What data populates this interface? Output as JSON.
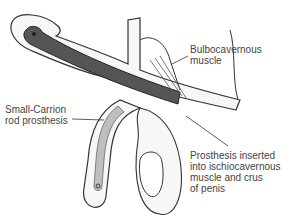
{
  "figure": {
    "labels": {
      "bulbocavernous": "Bulbocavernous\nmuscle",
      "rod": "Small-Carrion\nrod prosthesis",
      "inserted": "Prosthesis inserted\ninto ischiocavernous\nmuscle and crus\nof penis"
    },
    "colors": {
      "line": "#333333",
      "rod_dark": "#555555",
      "rod_light": "#bfbfbf",
      "text": "#444444"
    }
  }
}
